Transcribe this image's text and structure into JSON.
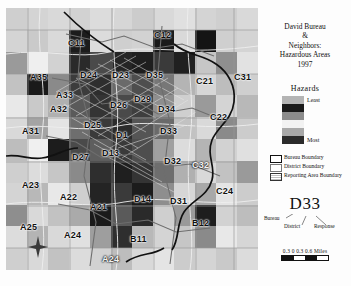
{
  "title": {
    "line1": "David Bureau",
    "line2": "&",
    "line3": "Neighbors:",
    "line4": "Hazardous Areas",
    "line5": "1997"
  },
  "legend": {
    "hazards_header": "Hazards",
    "least_label": "Least",
    "most_label": "Most",
    "ramp_colors": [
      "#b4b4b4",
      "#1a1a1a",
      "#8c8c8c",
      "#f2f2f2",
      "#a8a8a8",
      "#2b2b2b"
    ],
    "boundaries": [
      {
        "name": "bureau-boundary",
        "label": "Bureau Boundary"
      },
      {
        "name": "district-boundary",
        "label": "District Boundary"
      },
      {
        "name": "reporting-area-boundary",
        "label": "Reporting Area Boundary"
      }
    ]
  },
  "callout": {
    "code": "D33",
    "bureau": "Bureau",
    "district": "District",
    "response": "Response"
  },
  "scale": {
    "numbers": "0.3  0  0.3  0.6",
    "units": "Miles",
    "segments": [
      "#111111",
      "#ffffff",
      "#111111",
      "#ffffff"
    ]
  },
  "compass": {
    "name": "north-arrow"
  },
  "map": {
    "background": "#d9d9d9",
    "area_labels": [
      {
        "code": "C11",
        "x": 62,
        "y": 30,
        "tone": "onlight"
      },
      {
        "code": "C12",
        "x": 148,
        "y": 22,
        "tone": "onlight"
      },
      {
        "code": "A35",
        "x": 24,
        "y": 64,
        "tone": "onlight"
      },
      {
        "code": "D24",
        "x": 74,
        "y": 62,
        "tone": "onlight"
      },
      {
        "code": "D23",
        "x": 106,
        "y": 62,
        "tone": "onlight"
      },
      {
        "code": "D35",
        "x": 140,
        "y": 62,
        "tone": "onlight"
      },
      {
        "code": "C21",
        "x": 190,
        "y": 68,
        "tone": "onlight"
      },
      {
        "code": "C31",
        "x": 228,
        "y": 64,
        "tone": "onlight"
      },
      {
        "code": "A33",
        "x": 50,
        "y": 82,
        "tone": "onlight"
      },
      {
        "code": "A32",
        "x": 44,
        "y": 96,
        "tone": "onlight"
      },
      {
        "code": "D26",
        "x": 104,
        "y": 92,
        "tone": "onlight"
      },
      {
        "code": "D29",
        "x": 128,
        "y": 86,
        "tone": "onlight"
      },
      {
        "code": "D34",
        "x": 152,
        "y": 96,
        "tone": "onlight"
      },
      {
        "code": "C22",
        "x": 204,
        "y": 104,
        "tone": "onlight"
      },
      {
        "code": "A31",
        "x": 16,
        "y": 118,
        "tone": "onlight"
      },
      {
        "code": "D25",
        "x": 78,
        "y": 112,
        "tone": "onlight"
      },
      {
        "code": "D1",
        "x": 110,
        "y": 122,
        "tone": "onlight"
      },
      {
        "code": "D33",
        "x": 154,
        "y": 118,
        "tone": "onlight"
      },
      {
        "code": "D13",
        "x": 96,
        "y": 140,
        "tone": "onlight"
      },
      {
        "code": "D27",
        "x": 66,
        "y": 144,
        "tone": "onlight"
      },
      {
        "code": "D32",
        "x": 158,
        "y": 148,
        "tone": "onlight"
      },
      {
        "code": "C32",
        "x": 186,
        "y": 152,
        "tone": "ondark"
      },
      {
        "code": "A23",
        "x": 16,
        "y": 172,
        "tone": "onlight"
      },
      {
        "code": "A22",
        "x": 54,
        "y": 184,
        "tone": "onlight"
      },
      {
        "code": "A21",
        "x": 84,
        "y": 194,
        "tone": "onlight"
      },
      {
        "code": "D14",
        "x": 128,
        "y": 186,
        "tone": "onlight"
      },
      {
        "code": "D31",
        "x": 164,
        "y": 188,
        "tone": "onlight"
      },
      {
        "code": "C24",
        "x": 210,
        "y": 178,
        "tone": "onlight"
      },
      {
        "code": "A25",
        "x": 14,
        "y": 214,
        "tone": "onlight"
      },
      {
        "code": "A24",
        "x": 58,
        "y": 222,
        "tone": "onlight"
      },
      {
        "code": "B11",
        "x": 124,
        "y": 226,
        "tone": "onlight"
      },
      {
        "code": "B12",
        "x": 186,
        "y": 210,
        "tone": "onlight"
      },
      {
        "code": "A24",
        "x": 96,
        "y": 246,
        "tone": "ondark"
      }
    ],
    "choropleth_rows": [
      [
        "#cfcfcf",
        "#d4d4d4",
        "#d9d9d9",
        "#d2d2d2",
        "#dcdcdc",
        "#d6d6d6",
        "#cccccc",
        "#d9d9d9",
        "#e0e0e0",
        "#d4d4d4",
        "#cfcfcf",
        "#d9d9d9"
      ],
      [
        "#d4d4d4",
        "#cacaca",
        "#d9d9d9",
        "#1c1c1c",
        "#dcdcdc",
        "#cfcfcf",
        "#d2d2d2",
        "#1a1a1a",
        "#d9d9d9",
        "#141414",
        "#cfcfcf",
        "#d4d4d4"
      ],
      [
        "#9a9a9a",
        "#efefef",
        "#d2d2d2",
        "#2a2a2a",
        "#4a4a4a",
        "#252525",
        "#1e1e1e",
        "#3a3a3a",
        "#202020",
        "#c6c6c6",
        "#8f8f8f",
        "#e2e2e2"
      ],
      [
        "#c2c2c2",
        "#1a1a1a",
        "#8a8a8a",
        "#3c3c3c",
        "#2e2e2e",
        "#6a6a6a",
        "#4e4e4e",
        "#777777",
        "#b4b4b4",
        "#d6d6d6",
        "#bdbdbd",
        "#cfcfcf"
      ],
      [
        "#e8e8e8",
        "#c9c9c9",
        "#b0b0b0",
        "#5a5a5a",
        "#343434",
        "#4a4a4a",
        "#3e3e3e",
        "#8e8e8e",
        "#cfcfcf",
        "#9a9a9a",
        "#d4d4d4",
        "#b8b8b8"
      ],
      [
        "#d9d9d9",
        "#a4a4a4",
        "#e4e4e4",
        "#6e6e6e",
        "#3a3a3a",
        "#2c2c2c",
        "#555555",
        "#6a6a6a",
        "#c2c2c2",
        "#d9d9d9",
        "#8a8a8a",
        "#cccccc"
      ],
      [
        "#bdbdbd",
        "#f0f0f0",
        "#1c1c1c",
        "#4a4a4a",
        "#5e5e5e",
        "#3a3a3a",
        "#4e4e4e",
        "#a0a0a0",
        "#dcdcdc",
        "#b4b4b4",
        "#d2d2d2",
        "#e0e0e0"
      ],
      [
        "#cfcfcf",
        "#dcdcdc",
        "#c6c6c6",
        "#8a8a8a",
        "#2e2e2e",
        "#1f1f1f",
        "#343434",
        "#6e6e6e",
        "#b0b0b0",
        "#d9d9d9",
        "#c2c2c2",
        "#9a9a9a"
      ],
      [
        "#d4d4d4",
        "#b8b8b8",
        "#e8e8e8",
        "#cfcfcf",
        "#242424",
        "#3a3a3a",
        "#1c1c1c",
        "#8e8e8e",
        "#d6d6d6",
        "#a8a8a8",
        "#e4e4e4",
        "#cccccc"
      ],
      [
        "#8e8e8e",
        "#d9d9d9",
        "#c2c2c2",
        "#aaaaaa",
        "#1a1a1a",
        "#5a5a5a",
        "#2a2a2a",
        "#cfcfcf",
        "#9a9a9a",
        "#1e1e1e",
        "#d2d2d2",
        "#bdbdbd"
      ],
      [
        "#dcdcdc",
        "#b4b4b4",
        "#d9d9d9",
        "#e0e0e0",
        "#9e9e9e",
        "#2e2e2e",
        "#b8b8b8",
        "#d4d4d4",
        "#c6c6c6",
        "#8a8a8a",
        "#e8e8e8",
        "#d6d6d6"
      ],
      [
        "#cfcfcf",
        "#d9d9d9",
        "#c2c2c2",
        "#dcdcdc",
        "#d2d2d2",
        "#bdbdbd",
        "#d9d9d9",
        "#e4e4e4",
        "#cccccc",
        "#d4d4d4",
        "#c9c9c9",
        "#dcdcdc"
      ]
    ]
  }
}
